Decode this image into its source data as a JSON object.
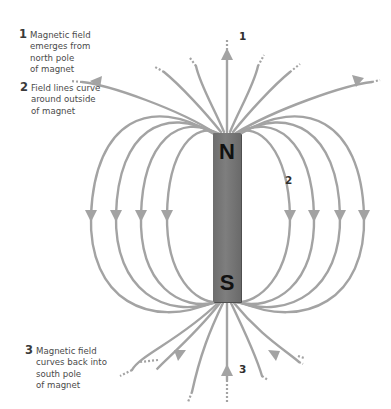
{
  "diagram": {
    "type": "bar-magnet-field-lines",
    "magnet": {
      "north_label": "N",
      "south_label": "S",
      "color": "#767676"
    },
    "field_line_color": "#a3a3a3",
    "annotations": [
      {
        "number": "1",
        "text": "Magnetic field\nemerges from\nnorth pole\nof magnet"
      },
      {
        "number": "2",
        "text": "Field lines curve\naround outside\nof magnet"
      },
      {
        "number": "3",
        "text": "Magnetic field\ncurves back into\nsouth pole\nof magnet"
      }
    ],
    "markers": [
      "1",
      "2",
      "3"
    ]
  }
}
